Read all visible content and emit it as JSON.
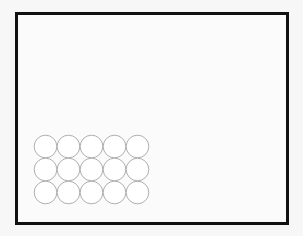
{
  "diagram": {
    "title": "",
    "frame": {
      "border_color": "#111111",
      "background": "#fbfbfb"
    },
    "circle_grid": {
      "rows": 3,
      "columns": 5,
      "count": 15,
      "stroke_color": "#999999",
      "fill_color": "#ffffff"
    }
  }
}
